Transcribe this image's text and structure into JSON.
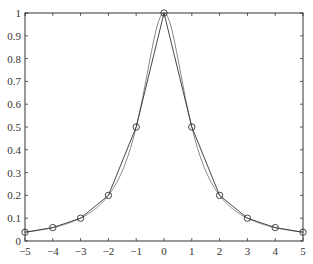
{
  "chart_data": {
    "type": "line",
    "title": "",
    "xlabel": "",
    "ylabel": "",
    "xlim": [
      -5,
      5
    ],
    "ylim": [
      0,
      1
    ],
    "grid": false,
    "legend": null,
    "x_ticks": [
      -5,
      -4,
      -3,
      -2,
      -1,
      0,
      1,
      2,
      3,
      4,
      5
    ],
    "x_tick_labels": [
      "-5",
      "-4",
      "-3",
      "-2",
      "-1",
      "0",
      "1",
      "2",
      "3",
      "4",
      "5"
    ],
    "y_ticks": [
      0,
      0.1,
      0.2,
      0.3,
      0.4,
      0.5,
      0.6,
      0.7,
      0.8,
      0.9,
      1
    ],
    "y_tick_labels": [
      "0",
      "0.1",
      "0.2",
      "0.3",
      "0.4",
      "0.5",
      "0.6",
      "0.7",
      "0.8",
      "0.9",
      "1"
    ],
    "series": [
      {
        "name": "piecewise linear interpolation",
        "style": "line with circle markers",
        "color": "#444444",
        "x": [
          -5,
          -4,
          -3,
          -2,
          -1,
          0,
          1,
          2,
          3,
          4,
          5
        ],
        "y": [
          0.0385,
          0.0588,
          0.1,
          0.2,
          0.5,
          1.0,
          0.5,
          0.2,
          0.1,
          0.0588,
          0.0385
        ]
      },
      {
        "name": "1/(1+x^2)",
        "style": "smooth line",
        "color": "#666666",
        "function": "1/(1+x^2)",
        "x_range": [
          -5,
          5
        ]
      }
    ]
  }
}
